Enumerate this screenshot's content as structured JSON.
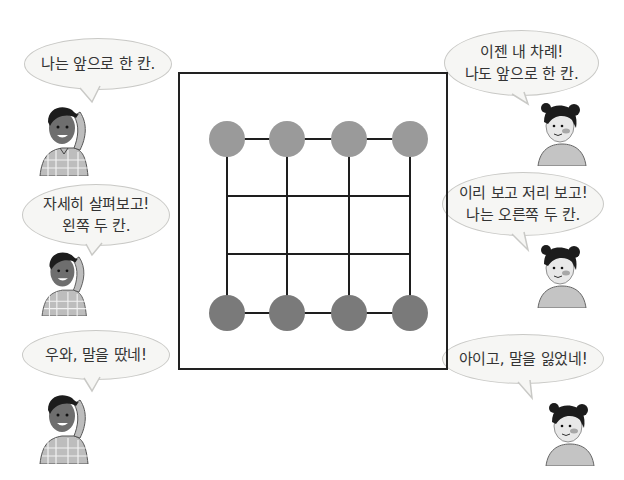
{
  "scene": {
    "description": "Board game comic: two players take turns moving pieces on a 4x4 grid board"
  },
  "board": {
    "columns": 4,
    "rows": 4,
    "grid_x": [
      227,
      287,
      349,
      410
    ],
    "grid_y": [
      139,
      196,
      254,
      313
    ],
    "piece_radius": 18,
    "top_pieces": {
      "row": 0,
      "color": "#9a9a9a",
      "owner": "girl"
    },
    "bottom_pieces": {
      "row": 3,
      "color": "#7a7a7a",
      "owner": "boy"
    },
    "line_color": "#1e1e1e",
    "frame_color": "#222222"
  },
  "dialogues": [
    {
      "id": "boy-1",
      "speaker": "boy",
      "lines": [
        "나는 앞으로 한 칸."
      ]
    },
    {
      "id": "girl-1",
      "speaker": "girl",
      "lines": [
        "이젠 내 차례!",
        "나도 앞으로 한 칸."
      ]
    },
    {
      "id": "boy-2",
      "speaker": "boy",
      "lines": [
        "자세히 살펴보고!",
        "왼쪽 두 칸."
      ]
    },
    {
      "id": "girl-2",
      "speaker": "girl",
      "lines": [
        "이리 보고 저리 보고!",
        "나는 오른쪽 두 칸."
      ]
    },
    {
      "id": "boy-3",
      "speaker": "boy",
      "lines": [
        "우와, 말을 땄네!"
      ]
    },
    {
      "id": "girl-3",
      "speaker": "girl",
      "lines": [
        "아이고, 말을 잃었네!"
      ]
    }
  ],
  "colors": {
    "bubble_fill": "#f6f6f4",
    "bubble_border": "#c9c9c6",
    "boy_skin": "#6e6e6e",
    "boy_shirt": "#bdbdbd",
    "girl_skin": "#e8e8e8",
    "girl_shirt": "#c4c4c4",
    "hair": "#1c1c1c",
    "cheek": "#a8a8a8"
  }
}
